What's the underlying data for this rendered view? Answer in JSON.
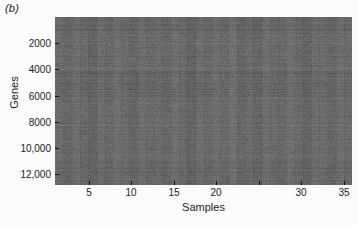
{
  "figure": {
    "panel_label": "(b)",
    "background_color": "#fcfcfc",
    "text_color": "#1a1a1a"
  },
  "chart_data": {
    "type": "heatmap",
    "title": "(b)",
    "xlabel": "Samples",
    "ylabel": "Genes",
    "xlim": [
      1,
      36
    ],
    "ylim": [
      1,
      12800
    ],
    "y_axis_direction": "reversed",
    "grid": false,
    "legend": "none",
    "colormap": "grayscale",
    "color_min": "#3a3a3a",
    "color_max": "#a8a8a8",
    "color_mean": "#6b6b6b",
    "n_samples": 36,
    "n_genes": 12800,
    "xticks": [
      5,
      10,
      15,
      20,
      25,
      30,
      35
    ],
    "xticklabels": [
      "5",
      "10",
      "15",
      "20",
      "",
      "30",
      "35"
    ],
    "yticks": [
      2000,
      4000,
      6000,
      8000,
      10000,
      12000
    ],
    "yticklabels": [
      "2000",
      "4000",
      "6000",
      "8000",
      "10,000",
      "12,000"
    ],
    "column_means": [
      0.44,
      0.4,
      0.46,
      0.42,
      0.38,
      0.45,
      0.41,
      0.47,
      0.43,
      0.39,
      0.46,
      0.42,
      0.44,
      0.4,
      0.47,
      0.43,
      0.38,
      0.45,
      0.41,
      0.46,
      0.42,
      0.48,
      0.4,
      0.44,
      0.39,
      0.46,
      0.43,
      0.41,
      0.47,
      0.42,
      0.38,
      0.45,
      0.44,
      0.4,
      0.46,
      0.43
    ]
  }
}
